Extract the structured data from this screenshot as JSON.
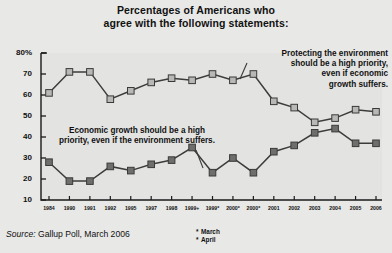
{
  "title": {
    "line1": "Percentages of Americans who",
    "line2": "agree with the following statements:"
  },
  "source": {
    "label": "Source:",
    "text": " Gallup Poll, March 2006"
  },
  "legend": {
    "items": [
      {
        "marker": "*",
        "label": "March"
      },
      {
        "marker": "*",
        "label": "April"
      }
    ]
  },
  "callouts": {
    "environment": {
      "line1": "Protecting the environment",
      "line2": "should be a high priority,",
      "line3": "even if economic",
      "line4": "growth suffers."
    },
    "economy": {
      "line1": "Economic growth should be a high",
      "line2": "priority, even if the environment suffers."
    }
  },
  "colors": {
    "background": "#e8e8e6",
    "plot_background": "#e3e3e1",
    "axis": "#1a1a1a",
    "environment_series": "#b8b8b6",
    "economy_series": "#6e6e6c",
    "line": "#3c3c3a",
    "text": "#111111"
  },
  "chart_data": {
    "type": "line",
    "title": "Percentages of Americans who agree with the following statements:",
    "xlabel": "",
    "ylabel": "",
    "ylim": [
      10,
      80
    ],
    "yticks": [
      "10",
      "20",
      "30",
      "40",
      "50",
      "60",
      "70",
      "80%"
    ],
    "grid": false,
    "legend_position": "bottom-right",
    "categories": [
      "1984",
      "1990",
      "1991",
      "1992",
      "1995",
      "1997",
      "1998",
      "1999+",
      "1999*",
      "2000*",
      "2000*",
      "2001",
      "2002",
      "2003",
      "2004",
      "2005",
      "2006"
    ],
    "series": [
      {
        "name": "Protecting the environment should be a high priority, even if economic growth suffers.",
        "marker": "square-light",
        "values": [
          61,
          71,
          71,
          58,
          62,
          66,
          68,
          67,
          70,
          67,
          70,
          57,
          54,
          47,
          49,
          53,
          52
        ]
      },
      {
        "name": "Economic growth should be a high priority, even if the environment suffers.",
        "marker": "square-dark",
        "values": [
          28,
          19,
          19,
          26,
          24,
          27,
          29,
          35,
          23,
          30,
          23,
          33,
          36,
          42,
          44,
          37,
          37
        ]
      }
    ]
  }
}
